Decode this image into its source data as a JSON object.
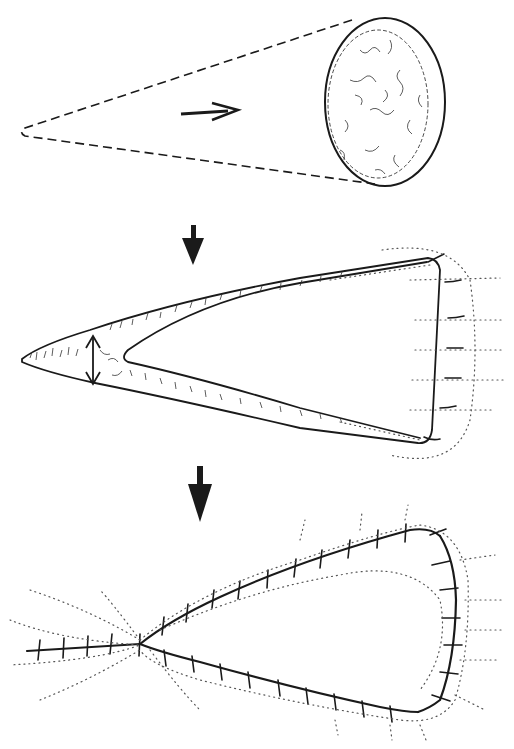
{
  "figure": {
    "kind": "surgical-technique-illustration",
    "panels": [
      {
        "id": "stage-1",
        "description": "cone-shaped excision outline with oval tissue surface and direction arrow"
      },
      {
        "id": "stage-2",
        "description": "triangular wound with width arrow and sutures on base edge"
      },
      {
        "id": "stage-3",
        "description": "teardrop closure with interrupted sutures along both edges"
      }
    ],
    "colors": {
      "ink": "#1a1a1a",
      "background": "#ffffff",
      "dots": "#555555"
    },
    "transition_arrows": 2,
    "labels": []
  }
}
